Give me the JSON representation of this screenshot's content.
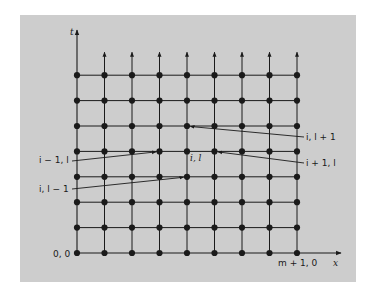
{
  "diagram": {
    "axes": {
      "vertical_label": "t",
      "horizontal_label": "x"
    },
    "grid": {
      "columns": 9,
      "rows": 8,
      "columns_description": "i = 0 .. m+1",
      "rows_description": "l = 0 .. 7",
      "open_top": true
    },
    "corner_labels": {
      "origin": "0, 0",
      "end": "m + 1, 0"
    },
    "center_node": {
      "label": "i, l",
      "col": 4,
      "row": 4
    },
    "neighbors": [
      {
        "label": "i, l + 1",
        "col": 4,
        "row": 5,
        "side": "right"
      },
      {
        "label": "i − 1, l",
        "col": 3,
        "row": 4,
        "side": "left"
      },
      {
        "label": "i + 1, l",
        "col": 5,
        "row": 4,
        "side": "right"
      },
      {
        "label": "i, l − 1",
        "col": 4,
        "row": 3,
        "side": "left"
      }
    ],
    "colors": {
      "panel": "#cdcdcd",
      "ink": "#1a1a1a"
    }
  }
}
